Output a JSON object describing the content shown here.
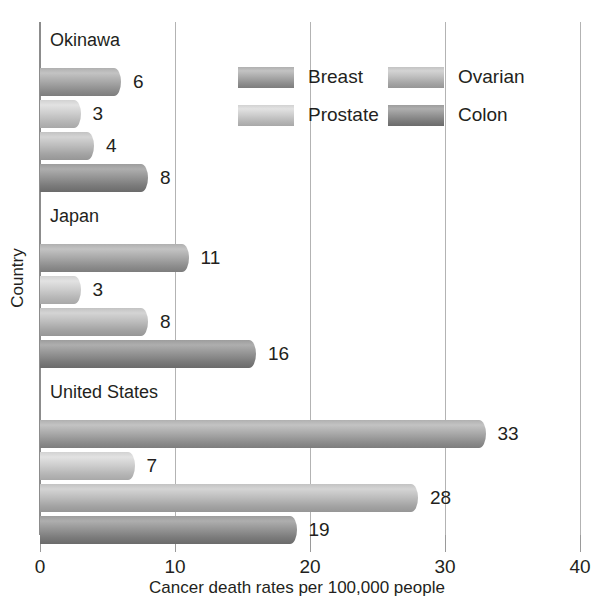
{
  "chart_data": {
    "type": "bar",
    "orientation": "horizontal",
    "title": "",
    "xlabel": "Cancer death rates per 100,000 people",
    "ylabel": "Country",
    "xlim": [
      0,
      40
    ],
    "xticks": [
      "0",
      "10",
      "20",
      "30",
      "40"
    ],
    "grid": true,
    "legend_position": "top-right-inside",
    "categories": [
      "Okinawa",
      "Japan",
      "United States"
    ],
    "series": [
      {
        "name": "Breast",
        "values": [
          6,
          11,
          33
        ]
      },
      {
        "name": "Prostate",
        "values": [
          3,
          3,
          7
        ]
      },
      {
        "name": "Ovarian",
        "values": [
          4,
          8,
          28
        ]
      },
      {
        "name": "Colon",
        "values": [
          8,
          16,
          19
        ]
      }
    ],
    "data_labels": [
      "6",
      "3",
      "4",
      "8",
      "11",
      "3",
      "8",
      "16",
      "33",
      "7",
      "28",
      "19"
    ],
    "colors": {
      "breast": "#a9a9a9",
      "prostate": "#cdcdcd",
      "ovarian": "#bdbdbd",
      "colon": "#949494",
      "gridline": "#b3b3b3",
      "axis": "#8c8c8c",
      "text": "#231f20"
    }
  },
  "axes": {
    "y_title": "Country",
    "x_title": "Cancer death rates per 100,000 people",
    "x_tick_labels": [
      {
        "label": "0"
      },
      {
        "label": "10"
      },
      {
        "label": "20"
      },
      {
        "label": "30"
      },
      {
        "label": "40"
      }
    ]
  },
  "legend": {
    "entries": [
      {
        "label": "Breast"
      },
      {
        "label": "Ovarian"
      },
      {
        "label": "Prostate"
      },
      {
        "label": "Colon"
      }
    ]
  },
  "groups": [
    {
      "label": "Okinawa",
      "bars": [
        {
          "series": "Breast",
          "value": 6,
          "label": "6"
        },
        {
          "series": "Prostate",
          "value": 3,
          "label": "3"
        },
        {
          "series": "Ovarian",
          "value": 4,
          "label": "4"
        },
        {
          "series": "Colon",
          "value": 8,
          "label": "8"
        }
      ]
    },
    {
      "label": "Japan",
      "bars": [
        {
          "series": "Breast",
          "value": 11,
          "label": "11"
        },
        {
          "series": "Prostate",
          "value": 3,
          "label": "3"
        },
        {
          "series": "Ovarian",
          "value": 8,
          "label": "8"
        },
        {
          "series": "Colon",
          "value": 16,
          "label": "16"
        }
      ]
    },
    {
      "label": "United States",
      "bars": [
        {
          "series": "Breast",
          "value": 33,
          "label": "33"
        },
        {
          "series": "Prostate",
          "value": 7,
          "label": "7"
        },
        {
          "series": "Ovarian",
          "value": 28,
          "label": "28"
        },
        {
          "series": "Colon",
          "value": 19,
          "label": "19"
        }
      ]
    }
  ]
}
